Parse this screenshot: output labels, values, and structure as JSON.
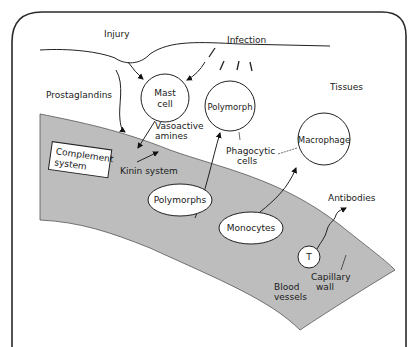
{
  "diagram": {
    "colors": {
      "background": "#ffffff",
      "border": "#2a2a2a",
      "vessel_fill": "#bdbdbd",
      "line": "#222222"
    },
    "labels": {
      "injury": "Injury",
      "infection": "Infection",
      "prostaglandins": "Prostaglandins",
      "tissues": "Tissues",
      "mast_cell_line1": "Mast",
      "mast_cell_line2": "cell",
      "polymorph": "Polymorph",
      "macrophage": "Macrophage",
      "vasoactive_line1": "Vasoactive",
      "vasoactive_line2": "amines",
      "phagocytic_line1": "Phagocytic",
      "phagocytic_line2": "cells",
      "complement_line1": "Complement",
      "complement_line2": "system",
      "kinin_system": "Kinin system",
      "polymorphs": "Polymorphs",
      "monocytes": "Monocytes",
      "antibodies": "Antibodies",
      "t_cell": "T",
      "capillary_line1": "Capillary",
      "capillary_line2": "wall",
      "blood_line1": "Blood",
      "blood_line2": "vessels"
    }
  }
}
